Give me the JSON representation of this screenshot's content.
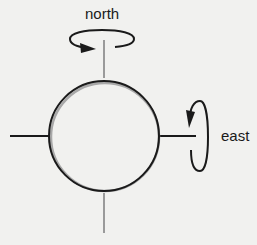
{
  "diagram": {
    "title": "",
    "labels": {
      "north": "north",
      "east": "east"
    },
    "elements": {
      "sphere": {
        "shape": "circle",
        "cx": 104,
        "cy": 136,
        "r": 55
      },
      "axes": [
        {
          "name": "north-axis",
          "x1": 104,
          "y1": 40,
          "x2": 104,
          "y2": 78,
          "color": "#9a9a9a"
        },
        {
          "name": "south-axis",
          "x1": 104,
          "y1": 193,
          "x2": 104,
          "y2": 233,
          "color": "#9a9a9a"
        },
        {
          "name": "west-axis",
          "x1": 10,
          "y1": 136,
          "x2": 49,
          "y2": 136,
          "color": "#1a1a1a"
        },
        {
          "name": "east-axis",
          "x1": 160,
          "y1": 136,
          "x2": 196,
          "y2": 136,
          "color": "#1a1a1a"
        }
      ],
      "rotation_arrows": [
        {
          "name": "north-rotation-arrow",
          "around": "north",
          "direction": "counterclockwise-viewed-from-top"
        },
        {
          "name": "east-rotation-arrow",
          "around": "east",
          "direction": "downward-front"
        }
      ]
    },
    "colors": {
      "background": "#f1f1ef",
      "stroke": "#1a1a1a",
      "gray_axis": "#9a9a9a"
    }
  }
}
